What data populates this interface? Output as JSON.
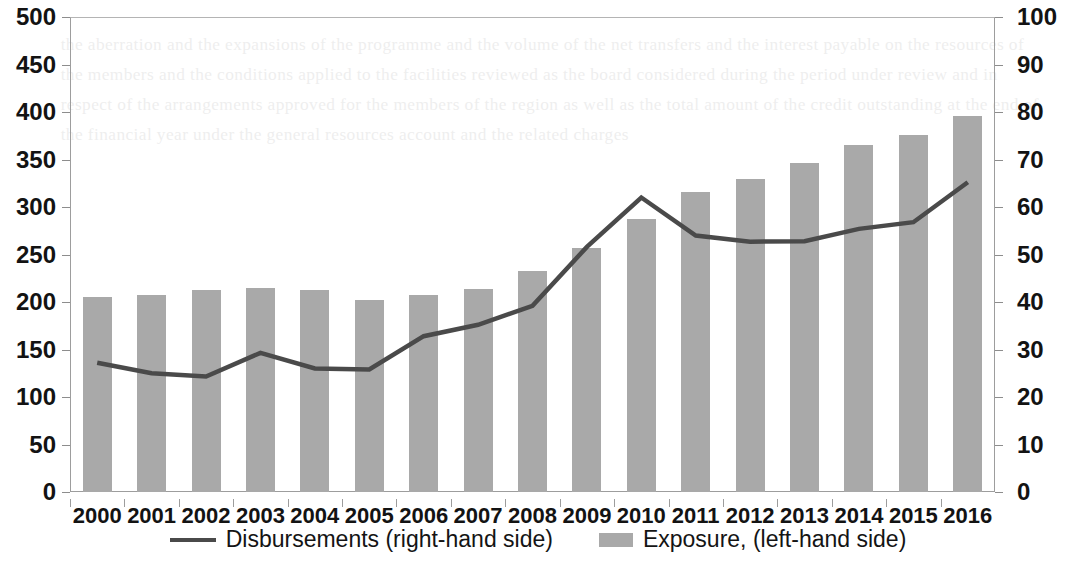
{
  "chart_data": {
    "type": "bar",
    "title": "",
    "subtitle": "",
    "xlabel": "",
    "ylabel": "",
    "grid": false,
    "legend_position": "bottom-center",
    "categories": [
      "2000",
      "2001",
      "2002",
      "2003",
      "2004",
      "2005",
      "2006",
      "2007",
      "2008",
      "2009",
      "2010",
      "2011",
      "2012",
      "2013",
      "2014",
      "2015",
      "2016"
    ],
    "axes": {
      "left": {
        "name": "left-axis",
        "min": 0,
        "max": 500,
        "step": 50,
        "ticks": [
          "0",
          "50",
          "100",
          "150",
          "200",
          "250",
          "300",
          "350",
          "400",
          "450",
          "500"
        ]
      },
      "right": {
        "name": "right-axis",
        "min": 0,
        "max": 100,
        "step": 10,
        "ticks": [
          "0",
          "10",
          "20",
          "30",
          "40",
          "50",
          "60",
          "70",
          "80",
          "90",
          "100"
        ]
      }
    },
    "series": [
      {
        "name": "Exposure, (left-hand side)",
        "type": "bar",
        "axis": "left",
        "color": "#a9a9a9",
        "values": [
          205,
          207,
          213,
          215,
          213,
          202,
          207,
          214,
          233,
          257,
          287,
          316,
          330,
          346,
          365,
          376,
          396
        ]
      },
      {
        "name": "Disbursements (right-hand side)",
        "type": "line",
        "axis": "right",
        "color": "#4a4a4a",
        "values": [
          27.2,
          25.0,
          24.3,
          29.3,
          26.0,
          25.8,
          32.8,
          35.2,
          39.2,
          51.6,
          62.0,
          54.0,
          52.7,
          52.8,
          55.4,
          56.8,
          65.2
        ]
      }
    ],
    "legend": [
      {
        "label": "Disbursements (right-hand side)",
        "marker": "line",
        "color": "#4a4a4a"
      },
      {
        "label": "Exposure, (left-hand side)",
        "marker": "square",
        "color": "#a9a9a9"
      }
    ]
  },
  "background_bleed": "the aberration and the expansions of the programme and the volume of the net transfers and the interest payable on the resources of the members and the conditions applied to the facilities reviewed as the board considered during the period under review and in respect of the arrangements approved for the members of the region as well as the total amount of the credit outstanding at the end of the financial year under the general resources account and the related charges"
}
